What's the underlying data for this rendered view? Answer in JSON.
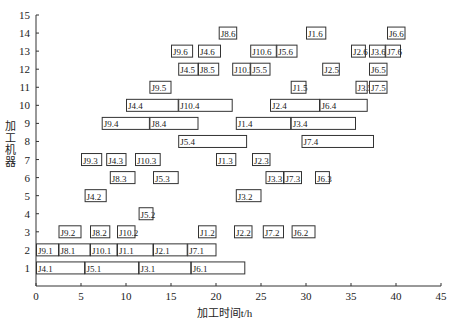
{
  "chart_data": {
    "type": "gantt",
    "title": "",
    "xlabel": "加工时间t/h",
    "ylabel": "加工机器",
    "xlim": [
      0,
      45
    ],
    "ylim": [
      0,
      15
    ],
    "xticks": [
      0,
      5,
      10,
      15,
      20,
      25,
      30,
      35,
      40,
      45
    ],
    "yticks": [
      1,
      2,
      3,
      4,
      5,
      6,
      7,
      8,
      9,
      10,
      11,
      12,
      13,
      14,
      15
    ],
    "grid": false,
    "legend": null,
    "bars": [
      {
        "machine": 1,
        "label": "J4.1",
        "start": 0,
        "end": 5.4
      },
      {
        "machine": 1,
        "label": "J5.1",
        "start": 5.4,
        "end": 11.4
      },
      {
        "machine": 1,
        "label": "J3.1",
        "start": 11.4,
        "end": 17.2
      },
      {
        "machine": 1,
        "label": "J6.1",
        "start": 17.2,
        "end": 23.2
      },
      {
        "machine": 2,
        "label": "J9.1",
        "start": 0,
        "end": 2.5
      },
      {
        "machine": 2,
        "label": "J8.1",
        "start": 2.5,
        "end": 6
      },
      {
        "machine": 2,
        "label": "J10.1",
        "start": 6,
        "end": 9
      },
      {
        "machine": 2,
        "label": "J1.1",
        "start": 9,
        "end": 13
      },
      {
        "machine": 2,
        "label": "J2.1",
        "start": 13,
        "end": 16.8
      },
      {
        "machine": 2,
        "label": "J7.1",
        "start": 16.8,
        "end": 20
      },
      {
        "machine": 3,
        "label": "J9.2",
        "start": 2.5,
        "end": 5
      },
      {
        "machine": 3,
        "label": "J8.2",
        "start": 6,
        "end": 8.2
      },
      {
        "machine": 3,
        "label": "J10.2",
        "start": 9,
        "end": 11
      },
      {
        "machine": 3,
        "label": "J1.2",
        "start": 18,
        "end": 20
      },
      {
        "machine": 3,
        "label": "J2.2",
        "start": 22,
        "end": 24
      },
      {
        "machine": 3,
        "label": "J7.2",
        "start": 25.2,
        "end": 27.5
      },
      {
        "machine": 3,
        "label": "J6.2",
        "start": 28.4,
        "end": 31
      },
      {
        "machine": 4,
        "label": "J5.2",
        "start": 11.4,
        "end": 13
      },
      {
        "machine": 5,
        "label": "J4.2",
        "start": 5.4,
        "end": 7.8
      },
      {
        "machine": 5,
        "label": "J3.2",
        "start": 22.2,
        "end": 25
      },
      {
        "machine": 6,
        "label": "J8.3",
        "start": 8.2,
        "end": 11
      },
      {
        "machine": 6,
        "label": "J5.3",
        "start": 13,
        "end": 15.8
      },
      {
        "machine": 6,
        "label": "J3.3",
        "start": 25.5,
        "end": 27.5
      },
      {
        "machine": 6,
        "label": "J7.3",
        "start": 27.5,
        "end": 29.5
      },
      {
        "machine": 6,
        "label": "J6.3",
        "start": 31,
        "end": 32.6
      },
      {
        "machine": 7,
        "label": "J9.3",
        "start": 5,
        "end": 7.3
      },
      {
        "machine": 7,
        "label": "J4.3",
        "start": 7.8,
        "end": 10
      },
      {
        "machine": 7,
        "label": "J10.3",
        "start": 11,
        "end": 13.8
      },
      {
        "machine": 7,
        "label": "J1.3",
        "start": 20,
        "end": 22.2
      },
      {
        "machine": 7,
        "label": "J2.3",
        "start": 24,
        "end": 26
      },
      {
        "machine": 8,
        "label": "J5.4",
        "start": 15.8,
        "end": 23.4
      },
      {
        "machine": 8,
        "label": "J7.4",
        "start": 29.5,
        "end": 37.5
      },
      {
        "machine": 9,
        "label": "J9.4",
        "start": 7.3,
        "end": 12.6
      },
      {
        "machine": 9,
        "label": "J8.4",
        "start": 12.6,
        "end": 18
      },
      {
        "machine": 9,
        "label": "J1.4",
        "start": 22.2,
        "end": 28.3
      },
      {
        "machine": 9,
        "label": "J3.4",
        "start": 28.3,
        "end": 35.5
      },
      {
        "machine": 10,
        "label": "J4.4",
        "start": 10,
        "end": 15.8
      },
      {
        "machine": 10,
        "label": "J10.4",
        "start": 15.8,
        "end": 21.8
      },
      {
        "machine": 10,
        "label": "J2.4",
        "start": 26,
        "end": 31.5
      },
      {
        "machine": 10,
        "label": "J6.4",
        "start": 31.5,
        "end": 36.8
      },
      {
        "machine": 11,
        "label": "J9.5",
        "start": 12.6,
        "end": 15
      },
      {
        "machine": 11,
        "label": "J1.5",
        "start": 28.3,
        "end": 30
      },
      {
        "machine": 11,
        "label": "J3.5",
        "start": 35.5,
        "end": 36.8
      },
      {
        "machine": 11,
        "label": "J7.5",
        "start": 37,
        "end": 39
      },
      {
        "machine": 12,
        "label": "J4.5",
        "start": 15.8,
        "end": 18
      },
      {
        "machine": 12,
        "label": "J8.5",
        "start": 18,
        "end": 20.3
      },
      {
        "machine": 12,
        "label": "J10.5",
        "start": 21.8,
        "end": 23.8
      },
      {
        "machine": 12,
        "label": "J5.5",
        "start": 23.8,
        "end": 26
      },
      {
        "machine": 12,
        "label": "J2.5",
        "start": 31.8,
        "end": 33.7
      },
      {
        "machine": 12,
        "label": "J6.5",
        "start": 37,
        "end": 39
      },
      {
        "machine": 13,
        "label": "J9.6",
        "start": 15,
        "end": 17.4
      },
      {
        "machine": 13,
        "label": "J4.6",
        "start": 18,
        "end": 20.5
      },
      {
        "machine": 13,
        "label": "J10.6",
        "start": 23.8,
        "end": 26.7
      },
      {
        "machine": 13,
        "label": "J5.6",
        "start": 26.7,
        "end": 29
      },
      {
        "machine": 13,
        "label": "J2.6",
        "start": 35,
        "end": 36.6
      },
      {
        "machine": 13,
        "label": "J3.6",
        "start": 37,
        "end": 38.8
      },
      {
        "machine": 13,
        "label": "J7.6",
        "start": 38.8,
        "end": 40.5
      },
      {
        "machine": 14,
        "label": "J8.6",
        "start": 20.3,
        "end": 22.3
      },
      {
        "machine": 14,
        "label": "J1.6",
        "start": 30,
        "end": 32.2
      },
      {
        "machine": 14,
        "label": "J6.6",
        "start": 39,
        "end": 41
      }
    ]
  },
  "axes": {
    "xlabel": "加工时间t/h",
    "ylabel": "加工机器"
  },
  "colors": {
    "bar_fill": "#ffffff",
    "bar_stroke": "#333333",
    "axis": "#333333",
    "text": "#222222"
  }
}
